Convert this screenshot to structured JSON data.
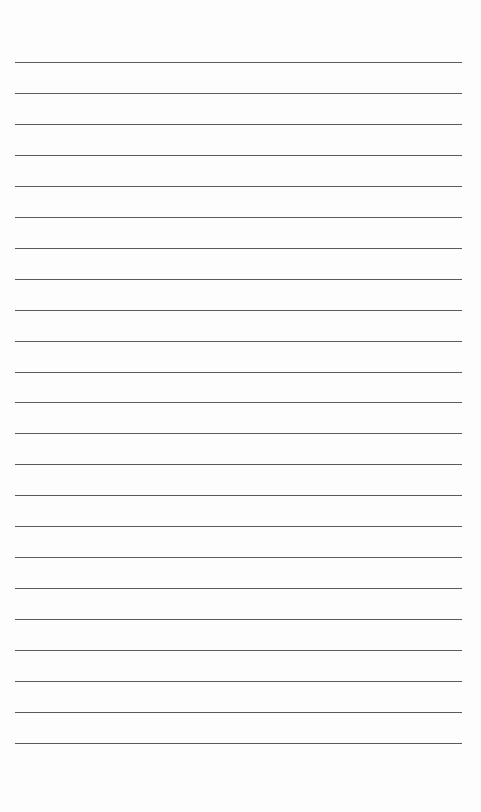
{
  "page": {
    "type": "lined-paper",
    "line_count": 23,
    "first_line_y": 62,
    "line_spacing": 30.95,
    "line_left": 15,
    "line_width": 447,
    "line_color": "#5a5a5a",
    "background_color": "#fdfdfd"
  }
}
